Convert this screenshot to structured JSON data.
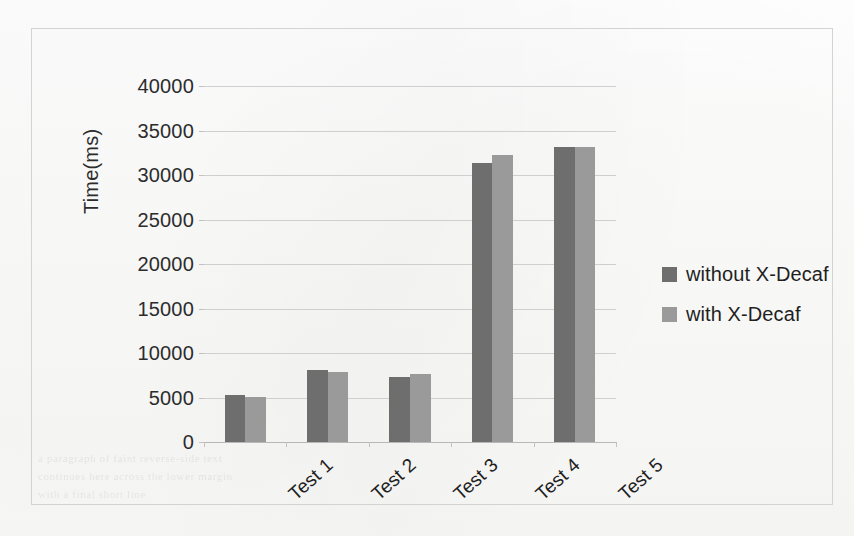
{
  "chart_data": {
    "type": "bar",
    "title": "",
    "xlabel": "",
    "ylabel": "Time(ms)",
    "categories": [
      "Test 1",
      "Test 2",
      "Test 3",
      "Test 4",
      "Test 5"
    ],
    "series": [
      {
        "name": "without X-Decaf",
        "color": "#6e6e6e",
        "values": [
          5300,
          8050,
          7300,
          31400,
          33200
        ]
      },
      {
        "name": "with X-Decaf",
        "color": "#9a9a9a",
        "values": [
          5050,
          7900,
          7600,
          32300,
          33200
        ]
      }
    ],
    "ylim": [
      0,
      40000
    ],
    "ytick_step": 5000,
    "ytick_labels": [
      "40000",
      "35000",
      "30000",
      "25000",
      "20000",
      "15000",
      "10000",
      "5000",
      "0"
    ],
    "grid": true,
    "grid_axis": "y",
    "legend_position": "right",
    "xtick_rotation": -42,
    "frame": true
  },
  "legend": {
    "entries": [
      {
        "label": "without X-Decaf",
        "color": "#6e6e6e"
      },
      {
        "label": "with X-Decaf",
        "color": "#9a9a9a"
      }
    ]
  },
  "page_artifacts": {
    "bleed_lines": [
      "a paragraph of faint reverse-side text",
      "continues here across the lower margin",
      "with a final short line"
    ]
  }
}
